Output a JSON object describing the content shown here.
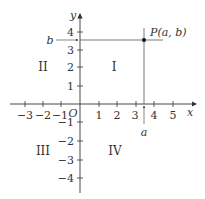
{
  "diagram": {
    "type": "coordinate-plane",
    "colors": {
      "axis": "#333333",
      "guide_line": "#555555",
      "point": "#111111",
      "text": "#333333"
    },
    "axes": {
      "x_label": "x",
      "y_label": "y",
      "origin_label": "O",
      "x_ticks": [
        "−3",
        "−2",
        "−1",
        "1",
        "2",
        "3",
        "4",
        "5"
      ],
      "y_ticks": [
        "4",
        "3",
        "2",
        "1",
        "−1",
        "−2",
        "−3",
        "−4"
      ]
    },
    "quadrants": {
      "I": "I",
      "II": "II",
      "III": "III",
      "IV": "IV"
    },
    "point": {
      "label": "P(a, b)",
      "x_name": "a",
      "y_name": "b",
      "approx_x": 3.5,
      "approx_y": 3.5
    }
  }
}
